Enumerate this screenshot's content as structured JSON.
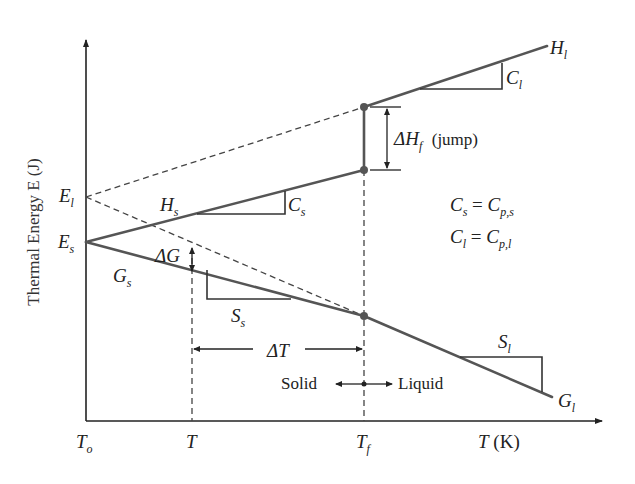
{
  "figure": {
    "y_axis_label": "Thermal Energy E (J)",
    "x_axis_label": {
      "var": "T",
      "unit": "(K)"
    },
    "x_ticks": [
      {
        "base": "T",
        "sub": "o"
      },
      {
        "base": "T",
        "sub": ""
      },
      {
        "base": "T",
        "sub": "f"
      }
    ],
    "y_ticks": [
      {
        "base": "E",
        "sub": "l"
      },
      {
        "base": "E",
        "sub": "s"
      }
    ],
    "curves": {
      "H_s": {
        "base": "H",
        "sub": "s"
      },
      "H_l": {
        "base": "H",
        "sub": "l"
      },
      "G_s": {
        "base": "G",
        "sub": "s"
      },
      "G_l": {
        "base": "G",
        "sub": "l"
      }
    },
    "slope_labels": {
      "C_s": {
        "base": "C",
        "sub": "s"
      },
      "C_l": {
        "base": "C",
        "sub": "l"
      },
      "S_s": {
        "base": "S",
        "sub": "s"
      },
      "S_l": {
        "base": "S",
        "sub": "l"
      }
    },
    "annotations": {
      "delta_g": "ΔG",
      "delta_t": "ΔT",
      "delta_hf": {
        "base": "ΔH",
        "sub": "f",
        "note": "(jump)"
      },
      "solid": "Solid",
      "liquid": "Liquid",
      "eq1": {
        "lhs": "C",
        "lhs_sub": "s",
        "rhs": "C",
        "rhs_sub": "p,s"
      },
      "eq2": {
        "lhs": "C",
        "lhs_sub": "l",
        "rhs": "C",
        "rhs_sub": "p,l"
      },
      "equals": "="
    },
    "colors": {
      "axis": "#222222",
      "curve": "#555555",
      "dashed": "#444444",
      "text": "#222222"
    }
  }
}
